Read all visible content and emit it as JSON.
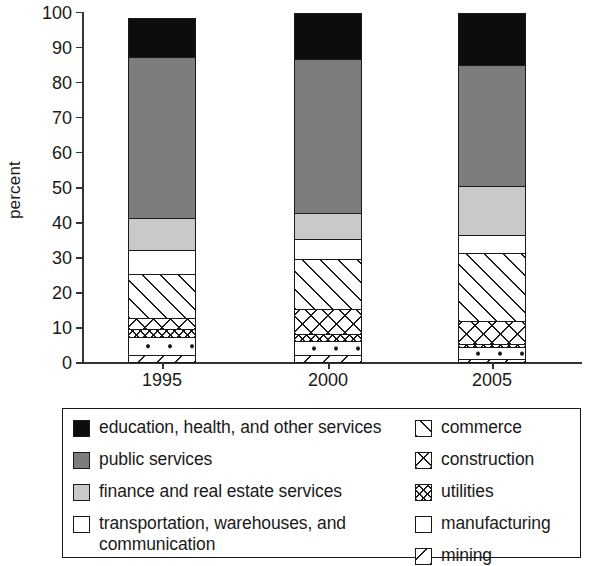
{
  "axis": {
    "ylabel": "percent",
    "yticks": [
      0,
      10,
      20,
      30,
      40,
      50,
      60,
      70,
      80,
      90,
      100
    ],
    "categories": [
      "1995",
      "2000",
      "2005"
    ]
  },
  "legend": {
    "left": [
      {
        "key": "education",
        "label": "education, health, and other services",
        "swatch": "solid-black"
      },
      {
        "key": "public",
        "label": "public services",
        "swatch": "solid-darkgray"
      },
      {
        "key": "finance",
        "label": "finance and real estate services",
        "swatch": "solid-lightgray"
      },
      {
        "key": "transport",
        "label": "transportation, warehouses, and",
        "label2": "communication",
        "swatch": "white"
      }
    ],
    "right": [
      {
        "key": "commerce",
        "label": "commerce",
        "swatch": "diagonal-forward"
      },
      {
        "key": "construction",
        "label": "construction",
        "swatch": "crosshatch"
      },
      {
        "key": "utilities",
        "label": "utilities",
        "swatch": "fine-crosshatch"
      },
      {
        "key": "manufacturing",
        "label": "manufacturing",
        "swatch": "white"
      },
      {
        "key": "mining",
        "label": "mining",
        "swatch": "diagonal-back"
      }
    ]
  },
  "colors": {
    "education": "#0d0d0d",
    "public": "#7d7d7d",
    "finance": "#c9c9c9",
    "transport": "#ffffff",
    "outline": "#1a1a1a"
  },
  "chart_data": {
    "type": "bar",
    "stacked": true,
    "title": "",
    "xlabel": "",
    "ylabel": "percent",
    "ylim": [
      0,
      100
    ],
    "grid": false,
    "legend_position": "bottom",
    "categories": [
      "1995",
      "2000",
      "2005"
    ],
    "series": [
      {
        "name": "mining",
        "values": [
          2.3,
          2.3,
          1.0
        ]
      },
      {
        "name": "manufacturing",
        "values": [
          5.0,
          4.0,
          3.5
        ]
      },
      {
        "name": "utilities",
        "values": [
          2.5,
          2.0,
          1.0
        ]
      },
      {
        "name": "construction",
        "values": [
          3.0,
          7.0,
          6.5
        ]
      },
      {
        "name": "commerce",
        "values": [
          12.5,
          14.5,
          19.5
        ]
      },
      {
        "name": "transportation, warehouses, and communication",
        "values": [
          7.0,
          5.5,
          5.0
        ]
      },
      {
        "name": "finance and real estate services",
        "values": [
          9.0,
          7.5,
          14.0
        ]
      },
      {
        "name": "public services",
        "values": [
          46.0,
          44.0,
          34.5
        ]
      },
      {
        "name": "education, health, and other services",
        "values": [
          11.0,
          13.0,
          15.0
        ]
      }
    ],
    "cumulative_tops": {
      "1995": [
        2.3,
        7.3,
        9.8,
        12.8,
        25.3,
        32.3,
        41.3,
        87.3,
        98.3
      ],
      "2000": [
        2.3,
        6.3,
        8.3,
        15.3,
        29.8,
        35.3,
        42.8,
        86.8,
        99.8
      ],
      "2005": [
        1.0,
        4.5,
        5.5,
        12.0,
        31.5,
        36.5,
        50.5,
        85.0,
        100.0
      ]
    }
  }
}
